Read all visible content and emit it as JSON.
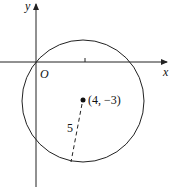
{
  "diagram": {
    "type": "circle-on-coordinate-plane",
    "axes": {
      "x_label": "x",
      "y_label": "y",
      "origin_label": "O"
    },
    "circle": {
      "center_label": "(4, −3)",
      "center": [
        4,
        -3
      ],
      "radius": 5,
      "radius_label": "5"
    },
    "colors": {
      "stroke": "#222222",
      "background": "#ffffff"
    }
  }
}
